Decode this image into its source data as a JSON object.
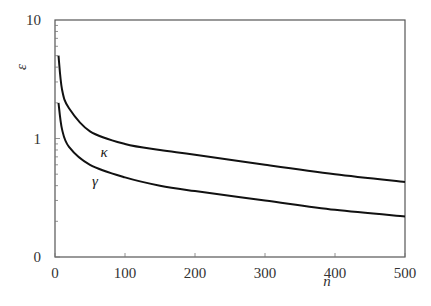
{
  "chart_data": {
    "type": "line",
    "title": "",
    "xlabel": "n",
    "ylabel": "ε",
    "xlim": [
      0,
      500
    ],
    "ylim": [
      0.1,
      10
    ],
    "yscale": "log",
    "grid": false,
    "legend": "inline labels",
    "x_ticks": [
      "0",
      "100",
      "200",
      "300",
      "400",
      "500"
    ],
    "y_ticks": [
      "0",
      "1",
      "10"
    ],
    "series": [
      {
        "name": "κ",
        "x": [
          5,
          10,
          20,
          50,
          100,
          150,
          200,
          300,
          400,
          500
        ],
        "values": [
          5.0,
          2.6,
          1.8,
          1.15,
          0.9,
          0.8,
          0.73,
          0.6,
          0.5,
          0.43
        ]
      },
      {
        "name": "γ",
        "x": [
          5,
          10,
          20,
          50,
          100,
          150,
          200,
          300,
          400,
          500
        ],
        "values": [
          2.0,
          1.2,
          0.85,
          0.6,
          0.47,
          0.4,
          0.36,
          0.3,
          0.25,
          0.22
        ]
      }
    ],
    "annotations": [
      {
        "text": "κ",
        "x": 70,
        "y": 0.76
      },
      {
        "text": "γ",
        "x": 57,
        "y": 0.43
      }
    ]
  }
}
